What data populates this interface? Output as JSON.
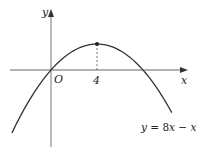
{
  "chart_data": {
    "type": "line",
    "title": "",
    "function": "y = 8x - x^2",
    "xlabel": "x",
    "ylabel": "y",
    "origin_label": "O",
    "x_ticks": [
      4
    ],
    "x_tick_labels": [
      "4"
    ],
    "marked_point": {
      "x": 4,
      "y": 16,
      "note": "maximum point, dashed line dropped to x-axis"
    },
    "roots": [
      0,
      8
    ],
    "x_range": [
      -3.4,
      10.5
    ],
    "series": [
      {
        "name": "y = 8x - x^2",
        "x": [
          -3.4,
          -2,
          -1,
          0,
          1,
          2,
          3,
          4,
          5,
          6,
          7,
          8,
          9,
          10,
          10.5
        ],
        "y": [
          -38.76,
          -20,
          -9,
          0,
          7,
          12,
          15,
          16,
          15,
          12,
          7,
          0,
          -9,
          -20,
          -26.25
        ]
      }
    ],
    "grid": false,
    "legend": "none"
  },
  "labels": {
    "y_axis": "y",
    "x_axis": "x",
    "origin": "O",
    "tick_4": "4",
    "equation_y": "y",
    "equation_eq": " = 8",
    "equation_x1": "x",
    "equation_minus": " − ",
    "equation_x2": "x",
    "equation_exp": "2"
  },
  "colors": {
    "curve": "#333333",
    "axes": "#555555",
    "background": "#ffffff"
  }
}
